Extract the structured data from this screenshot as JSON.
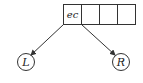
{
  "diagram": {
    "record": {
      "cells": [
        "ec",
        "",
        "",
        ""
      ]
    },
    "nodes": {
      "left": "L",
      "right": "R"
    },
    "colors": {
      "stroke": "#333333",
      "background": "#ffffff"
    }
  }
}
